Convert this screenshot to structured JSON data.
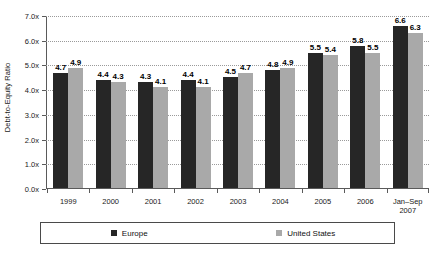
{
  "chart_data": {
    "type": "bar",
    "title": "",
    "subtitle": "",
    "xlabel": "",
    "ylabel": "Debt-to-Equity Ratio",
    "categories": [
      "1999",
      "2000",
      "2001",
      "2002",
      "2003",
      "2004",
      "2005",
      "2006",
      "Jan–Sep 2007"
    ],
    "category_lines": [
      [
        "1999"
      ],
      [
        "2000"
      ],
      [
        "2001"
      ],
      [
        "2002"
      ],
      [
        "2003"
      ],
      [
        "2004"
      ],
      [
        "2005"
      ],
      [
        "2006"
      ],
      [
        "Jan–Sep",
        "2007"
      ]
    ],
    "series": [
      {
        "name": "Europe",
        "color": "#262626",
        "values": [
          4.7,
          4.4,
          4.3,
          4.4,
          4.5,
          4.8,
          5.5,
          5.8,
          6.6
        ]
      },
      {
        "name": "United States",
        "color": "#a9a9a9",
        "values": [
          4.9,
          4.3,
          4.1,
          4.1,
          4.7,
          4.9,
          5.4,
          5.5,
          6.3
        ]
      }
    ],
    "ylim": [
      0.0,
      7.0
    ],
    "yticks": [
      0.0,
      1.0,
      2.0,
      3.0,
      4.0,
      5.0,
      6.0,
      7.0
    ],
    "ytick_labels": [
      "0.0x",
      "1.0x",
      "2.0x",
      "3.0x",
      "4.0x",
      "5.0x",
      "6.0x",
      "7.0x"
    ],
    "value_label_format": "one-decimal",
    "grid": {
      "horizontal": true,
      "style": "dotted",
      "color": "#9a9a9a",
      "vertical": false
    },
    "legend": {
      "position": "bottom",
      "bordered": true,
      "entries": [
        "Europe",
        "United States"
      ]
    },
    "background_color": "#ffffff",
    "axis_color": "#5a5a5a"
  },
  "legend": {
    "europe_label": "Europe",
    "us_label": "United States"
  }
}
